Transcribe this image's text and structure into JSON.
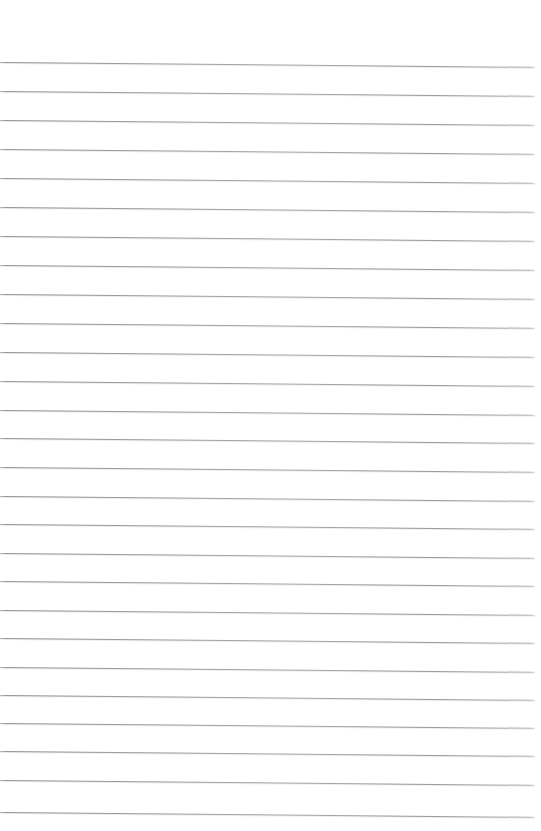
{
  "document": {
    "kind": "scanned-lined-paper",
    "title": "Blank Ruled Notebook Page",
    "page_width": 541,
    "page_height": 831,
    "paper_color": "#ffffff",
    "rule_color": "#93959a",
    "rule_thickness_px": 1,
    "top_margin_px": 58,
    "left_inset_px": 0,
    "right_inset_px": 6,
    "tilt_degrees": 0.52,
    "line_count": 27,
    "content_text": "",
    "has_handwriting": false,
    "has_margin_rule": false
  },
  "lines": [
    {
      "index": 1,
      "y": 62,
      "tilt": 0.52
    },
    {
      "index": 2,
      "y": 91,
      "tilt": 0.52
    },
    {
      "index": 3,
      "y": 120,
      "tilt": 0.52
    },
    {
      "index": 4,
      "y": 149,
      "tilt": 0.52
    },
    {
      "index": 5,
      "y": 178,
      "tilt": 0.52
    },
    {
      "index": 6,
      "y": 207,
      "tilt": 0.52
    },
    {
      "index": 7,
      "y": 236,
      "tilt": 0.52
    },
    {
      "index": 8,
      "y": 265,
      "tilt": 0.52
    },
    {
      "index": 9,
      "y": 294,
      "tilt": 0.52
    },
    {
      "index": 10,
      "y": 323,
      "tilt": 0.52
    },
    {
      "index": 11,
      "y": 352,
      "tilt": 0.52
    },
    {
      "index": 12,
      "y": 381,
      "tilt": 0.52
    },
    {
      "index": 13,
      "y": 410,
      "tilt": 0.52
    },
    {
      "index": 14,
      "y": 438,
      "tilt": 0.52
    },
    {
      "index": 15,
      "y": 467,
      "tilt": 0.52
    },
    {
      "index": 16,
      "y": 496,
      "tilt": 0.52
    },
    {
      "index": 17,
      "y": 524,
      "tilt": 0.52
    },
    {
      "index": 18,
      "y": 553,
      "tilt": 0.52
    },
    {
      "index": 19,
      "y": 581,
      "tilt": 0.52
    },
    {
      "index": 20,
      "y": 610,
      "tilt": 0.52
    },
    {
      "index": 21,
      "y": 638,
      "tilt": 0.52
    },
    {
      "index": 22,
      "y": 667,
      "tilt": 0.52
    },
    {
      "index": 23,
      "y": 695,
      "tilt": 0.52
    },
    {
      "index": 24,
      "y": 723,
      "tilt": 0.52
    },
    {
      "index": 25,
      "y": 751,
      "tilt": 0.52
    },
    {
      "index": 26,
      "y": 780,
      "tilt": 0.52
    },
    {
      "index": 27,
      "y": 812,
      "tilt": 0.52
    }
  ]
}
